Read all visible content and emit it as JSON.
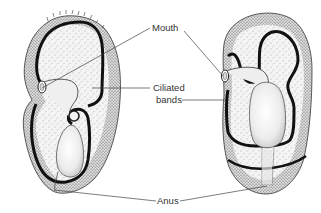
{
  "figure": {
    "colors": {
      "background": "#ffffff",
      "ink": "#1a1a1a",
      "stipple": "#555555",
      "body_fill": "#f2f2f2",
      "gut_fill": "#e6e6e6",
      "label_text": "#333333"
    }
  },
  "labels": {
    "mouth": "Mouth",
    "ciliated_line1": "Ciliated",
    "ciliated_line2": "bands",
    "anus": "Anus"
  },
  "specimens": [
    {
      "name": "left-larva",
      "view": "lateral"
    },
    {
      "name": "right-larva",
      "view": "ventral"
    }
  ]
}
